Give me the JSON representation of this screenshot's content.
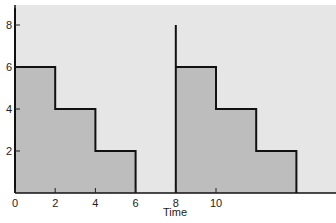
{
  "chart_data": {
    "type": "area",
    "title": "",
    "xlabel": "Time",
    "ylabel": "",
    "xlim": [
      0,
      16
    ],
    "ylim": [
      0,
      8.8
    ],
    "grid": false,
    "legend": null,
    "x_ticks": [
      "0",
      "2",
      "4",
      "6",
      "8",
      "10"
    ],
    "y_ticks": [
      "2",
      "4",
      "6",
      "8"
    ],
    "series": [
      {
        "name": "cycle-1",
        "step": true,
        "x": [
          0,
          2,
          4,
          6
        ],
        "values": [
          6,
          4,
          2,
          0
        ]
      },
      {
        "name": "cycle-2",
        "step": true,
        "x": [
          8,
          10,
          12,
          14
        ],
        "values": [
          6,
          4,
          2,
          0
        ]
      }
    ],
    "annotations": [
      {
        "type": "vertical-line",
        "x": 0,
        "from": 0,
        "to": 8.8
      },
      {
        "type": "vertical-line",
        "x": 8,
        "from": 0,
        "to": 8
      }
    ],
    "colors": {
      "background": "#e6e6e6",
      "fill": "#bdbdbd",
      "line": "#111111"
    }
  }
}
